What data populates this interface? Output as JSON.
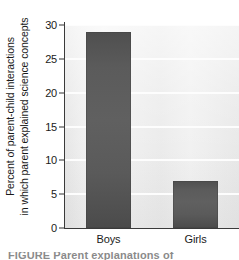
{
  "chart_data": {
    "type": "bar",
    "title": "",
    "xlabel": "",
    "ylabel_line1": "Percent of parent-child interactions",
    "ylabel_line2": "in which parent explained science concepts",
    "categories": [
      "Boys",
      "Girls"
    ],
    "values": [
      29,
      7
    ],
    "ylim": [
      0,
      30
    ],
    "yticks": [
      0,
      5,
      10,
      15,
      20,
      25,
      30
    ],
    "ytick_labels": [
      "0",
      "5",
      "10",
      "15",
      "20",
      "25",
      "30"
    ],
    "grid": true,
    "legend": "none",
    "series_color": "#5a5a5a",
    "plot_background": "#eeeeee",
    "gridline_color": "#fdfdfd",
    "axis_color": "#3a3a3a",
    "text_color": "#1a1a1a"
  },
  "caption": {
    "clipped_text": "FIGURE  Parent explanations of"
  }
}
